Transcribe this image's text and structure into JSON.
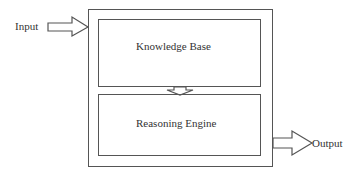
{
  "diagram": {
    "type": "block-diagram",
    "input": {
      "label": "Input"
    },
    "output": {
      "label": "Output"
    },
    "container": {
      "label": ""
    },
    "blocks": [
      {
        "id": "knowledge-base",
        "label": "Knowledge Base"
      },
      {
        "id": "reasoning-engine",
        "label": "Reasoning Engine"
      }
    ],
    "connections": [
      {
        "from": "Input",
        "to": "container",
        "style": "hollow-arrow"
      },
      {
        "from": "knowledge-base",
        "to": "reasoning-engine",
        "style": "hollow-arrow-down"
      },
      {
        "from": "container",
        "to": "Output",
        "style": "hollow-arrow"
      }
    ],
    "colors": {
      "stroke": "#555555",
      "text": "#333333",
      "background": "#ffffff"
    }
  }
}
